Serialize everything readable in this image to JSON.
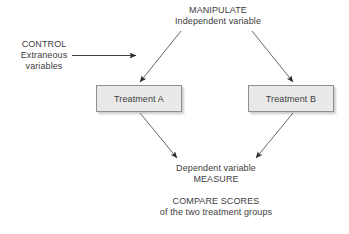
{
  "diagram": {
    "background_color": "#ffffff",
    "text_color": "#3d3d3d",
    "labels": {
      "manipulate": {
        "line1": "MANIPULATE",
        "line2": "Independent variable"
      },
      "control": {
        "line1": "CONTROL",
        "line2": "Extraneous",
        "line3": "variables"
      },
      "dependent": {
        "line1": "Dependent variable",
        "line2": "MEASURE"
      },
      "compare": {
        "line1": "COMPARE SCORES",
        "line2": "of the two treatment groups"
      }
    },
    "boxes": [
      {
        "id": "treatment-a",
        "label": "Treatment A",
        "fill_color": "#e9e9e9",
        "border_color": "#8f8f8f"
      },
      {
        "id": "treatment-b",
        "label": "Treatment B",
        "fill_color": "#e9e9e9",
        "border_color": "#8f8f8f"
      }
    ],
    "arrows": [
      {
        "id": "control-to-center",
        "direction": "right",
        "from": "CONTROL Extraneous variables",
        "to": "design center"
      },
      {
        "id": "manipulate-to-treatment-a",
        "direction": "down-left",
        "from": "Independent variable",
        "to": "Treatment A"
      },
      {
        "id": "manipulate-to-treatment-b",
        "direction": "down-right",
        "from": "Independent variable",
        "to": "Treatment B"
      },
      {
        "id": "treatment-a-to-dependent",
        "direction": "down-right",
        "from": "Treatment A",
        "to": "Dependent variable MEASURE"
      },
      {
        "id": "treatment-b-to-dependent",
        "direction": "down-left",
        "from": "Treatment B",
        "to": "Dependent variable MEASURE"
      }
    ]
  }
}
